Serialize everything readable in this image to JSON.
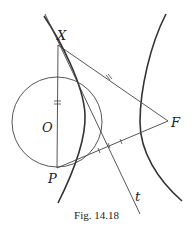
{
  "figure": {
    "caption": "Fig. 14.18",
    "labels": {
      "X": "X",
      "O": "O",
      "P": "P",
      "F": "F",
      "t": "t"
    },
    "points": {
      "X": [
        58,
        45
      ],
      "O": [
        57,
        122
      ],
      "P": [
        57,
        168
      ],
      "F": [
        168,
        121
      ]
    },
    "elements": [
      "hyperbola left branch",
      "hyperbola right branch",
      "circle centered at O through X and P",
      "tangent line t through X",
      "segment XF with double tick mark",
      "segment PF with single tick marks",
      "segment XP (diameter) with double tick mark"
    ],
    "colors": {
      "ink": "#333333",
      "background": "#ffffff"
    }
  }
}
